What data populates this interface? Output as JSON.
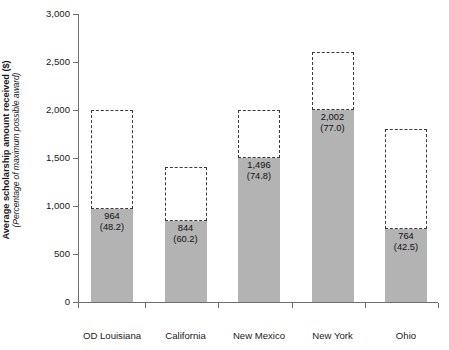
{
  "chart_data": {
    "type": "bar",
    "title": "",
    "subtitle": "",
    "xlabel": "",
    "ylabel": "Average scholarship amount received ($)",
    "ylabel_sub": "(Percentage of maximum possible award)",
    "ylim": [
      0,
      3000
    ],
    "ytick_values": [
      0,
      500,
      1000,
      1500,
      2000,
      2500,
      3000
    ],
    "ytick_labels": [
      "0",
      "500",
      "1,000",
      "1,500",
      "2,000",
      "2,500",
      "3,000"
    ],
    "grid": false,
    "legend": null,
    "categories": [
      "OD Louisiana",
      "California",
      "New Mexico",
      "New York",
      "Ohio"
    ],
    "series": [
      {
        "name": "Average scholarship amount received",
        "style": "filled-gray",
        "values": [
          964,
          844,
          1496,
          2002,
          764
        ]
      },
      {
        "name": "Maximum possible award",
        "style": "dashed-outline",
        "values": [
          2000,
          1402,
          2000,
          2600,
          1798
        ]
      }
    ],
    "data_labels": [
      {
        "category": "OD Louisiana",
        "value": "964",
        "percent": "(48.2)"
      },
      {
        "category": "California",
        "value": "844",
        "percent": "(60.2)"
      },
      {
        "category": "New Mexico",
        "value": "1,496",
        "percent": "(74.8)"
      },
      {
        "category": "New York",
        "value": "2,002",
        "percent": "(77.0)"
      },
      {
        "category": "Ohio",
        "value": "764",
        "percent": "(42.5)"
      }
    ],
    "colors": {
      "bar_fill": "#b3b3b3",
      "dashed_outline": "#3a3a3a",
      "axis": "#6e6e6e",
      "text": "#1a1a1a",
      "background": "#ffffff"
    }
  }
}
